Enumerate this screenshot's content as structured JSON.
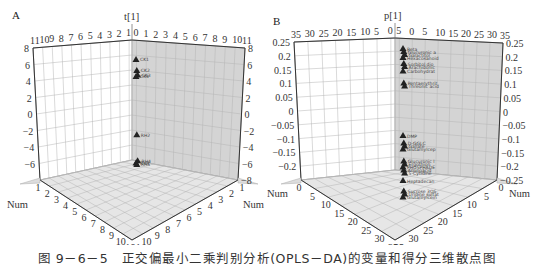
{
  "caption": "图 9－6－5　正交偏最小二乘判别分析(OPLS－DA)的变量和得分三维散点图",
  "colors": {
    "right_wall": "#d2d2d2",
    "left_wall": "#ffffff",
    "floor": "#e4e4e4",
    "grid": "#a8a8a8",
    "axis": "#333333",
    "marker": "#222222"
  },
  "chart_data": [
    {
      "panel_label": "A",
      "type": "scatter",
      "title": "t[1]",
      "vertical_axis": {
        "label": "t[1]",
        "ticks": [
          "8",
          "6",
          "4",
          "2",
          "0",
          "−2",
          "−4",
          "−6"
        ],
        "ticks_right": [
          "8",
          "6",
          "4",
          "2",
          "0",
          "−2",
          "−4",
          "−6",
          "−8"
        ],
        "range": [
          -8,
          8
        ]
      },
      "top_left_ticks": [
        "11",
        "10",
        "9",
        "8",
        "7",
        "6",
        "5",
        "4",
        "3",
        "2",
        "1"
      ],
      "top_right_ticks": [
        "0",
        "1",
        "2",
        "3",
        "4",
        "5",
        "6",
        "7",
        "8",
        "9",
        "10",
        "11"
      ],
      "floor_left_axis": {
        "label": "Num",
        "ticks": [
          "1",
          "2",
          "3",
          "4",
          "5",
          "6",
          "7",
          "8",
          "9",
          "10",
          "11"
        ]
      },
      "floor_right_axis": {
        "label": "Num",
        "ticks": [
          "1",
          "2",
          "3",
          "4",
          "5",
          "6",
          "7",
          "8",
          "9",
          "10",
          "11"
        ]
      },
      "points": [
        {
          "label": "CK1",
          "t1": 6.3
        },
        {
          "label": "CK2",
          "t1": 4.8
        },
        {
          "label": "CK3",
          "t1": 4.2
        },
        {
          "label": "CK4",
          "t1": 4.0
        },
        {
          "label": "RH2",
          "t1": -3.9
        },
        {
          "label": "RH4",
          "t1": -7.4
        },
        {
          "label": "RH3",
          "t1": -7.7
        },
        {
          "label": "RH5",
          "t1": -7.9
        }
      ]
    },
    {
      "panel_label": "B",
      "type": "scatter",
      "title": "p[1]",
      "vertical_axis": {
        "label": "p[1]",
        "ticks": [
          "0.25",
          "0.2",
          "0.15",
          "0.1",
          "0.05",
          "0",
          "−0.05",
          "−0.1",
          "−0.15",
          "−0.2"
        ],
        "ticks_right": [
          "0.25",
          "0.2",
          "0.15",
          "0.1",
          "0.05",
          "0",
          "−0.05",
          "−0.1",
          "−0.15",
          "−0.2",
          "−0.25"
        ],
        "range": [
          -0.25,
          0.25
        ]
      },
      "top_left_ticks": [
        "35",
        "30",
        "25",
        "20",
        "15",
        "10",
        "5",
        "0"
      ],
      "top_right_ticks": [
        "5",
        "0",
        "5",
        "10",
        "15",
        "20",
        "25",
        "30",
        "35"
      ],
      "floor_left_axis": {
        "label": "Num",
        "ticks": [
          "0",
          "5",
          "10",
          "15",
          "20",
          "25",
          "30",
          "35"
        ]
      },
      "floor_right_axis": {
        "label": "Num",
        "ticks": [
          "0",
          "5",
          "10",
          "15",
          "20",
          "25",
          "30",
          "35"
        ]
      },
      "points": [
        {
          "label": "Beta",
          "p1": 0.215
        },
        {
          "label": "Glucuronic a",
          "p1": 0.205
        },
        {
          "label": "Galactitol",
          "p1": 0.195
        },
        {
          "label": "Hexacosanoid",
          "p1": 0.185
        },
        {
          "label": "Sorbitol dio",
          "p1": 0.165
        },
        {
          "label": "Arachidonic",
          "p1": 0.155
        },
        {
          "label": "Carbohydrat",
          "p1": 0.14
        },
        {
          "label": "Pentaerythrit",
          "p1": 0.1
        },
        {
          "label": "Threonic acid",
          "p1": 0.09
        },
        {
          "label": "DMP",
          "p1": -0.075
        },
        {
          "label": "D-GGLC",
          "p1": -0.1
        },
        {
          "label": "Gallate",
          "p1": -0.11
        },
        {
          "label": "Glutamylcep",
          "p1": -0.12
        },
        {
          "label": "Glucuronic l",
          "p1": -0.16
        },
        {
          "label": "Ergothion",
          "p1": -0.17
        },
        {
          "label": "PHOSPHADE",
          "p1": -0.18
        },
        {
          "label": "Aminoacid",
          "p1": -0.19
        },
        {
          "label": "5-Cytidine",
          "p1": -0.2
        },
        {
          "label": "Heptadecan",
          "p1": -0.225
        },
        {
          "label": "Sucrose 3OS",
          "p1": -0.26
        },
        {
          "label": "Uridine sulfat",
          "p1": -0.27
        },
        {
          "label": "Glutamylcein",
          "p1": -0.28
        }
      ]
    }
  ]
}
